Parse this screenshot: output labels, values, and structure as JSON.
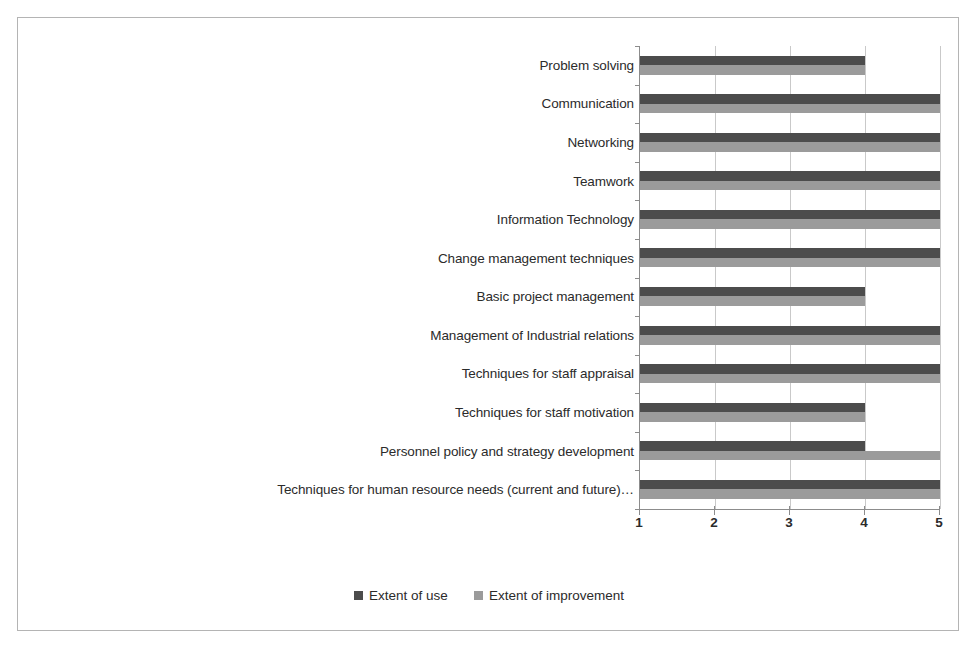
{
  "chart_data": {
    "type": "bar",
    "orientation": "horizontal",
    "title": "",
    "subtitle": "",
    "xlabel": "",
    "ylabel": "",
    "xlim": [
      1,
      5
    ],
    "xticks": [
      "1",
      "2",
      "3",
      "4",
      "5"
    ],
    "grid": true,
    "legend_position": "bottom-center",
    "categories": [
      "Problem solving",
      "Communication",
      "Networking",
      "Teamwork",
      "Information Technology",
      "Change management techniques",
      "Basic project management",
      "Management of Industrial relations",
      "Techniques for staff appraisal",
      "Techniques for staff motivation",
      "Personnel policy and strategy development",
      "Techniques for human resource needs (current and future)…"
    ],
    "series": [
      {
        "name": "Extent of use",
        "color": "#4c4c4c",
        "values": [
          4,
          5,
          5,
          5,
          5,
          5,
          4,
          5,
          5,
          4,
          4,
          5
        ]
      },
      {
        "name": "Extent of improvement",
        "color": "#9b9b9b",
        "values": [
          4,
          5,
          5,
          5,
          5,
          5,
          4,
          5,
          5,
          4,
          5,
          5
        ]
      }
    ]
  },
  "legend": {
    "items": [
      {
        "label": "Extent of use",
        "color": "#4c4c4c"
      },
      {
        "label": "Extent of improvement",
        "color": "#9b9b9b"
      }
    ]
  },
  "style": {
    "frame_border": "#b4b4b4",
    "axis_color": "#8c8c8c",
    "gridline_color": "#c9c9c9",
    "text_color": "#2b2b2b",
    "background": "#ffffff"
  }
}
